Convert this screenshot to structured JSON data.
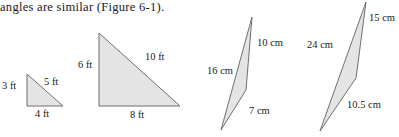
{
  "caption": {
    "text": "angles are similar (Figure 6-1)."
  },
  "colors": {
    "page_background": "#ffffff",
    "triangle_fill": "#e4e4e4",
    "triangle_stroke": "#6f6f6f",
    "text": "#1a1a1a"
  },
  "figure": {
    "name": "Figure 6-1",
    "triangles": [
      {
        "id": "triangle-1",
        "units": "ft",
        "labels": {
          "left": "3 ft",
          "hypotenuse": "5 ft",
          "bottom": "4 ft"
        },
        "points": "27,74 27,106 63,106",
        "sides": {
          "left": 3,
          "bottom": 4,
          "hypotenuse": 5
        }
      },
      {
        "id": "triangle-2",
        "units": "ft",
        "labels": {
          "left": "6 ft",
          "hypotenuse": "10 ft",
          "bottom": "8 ft"
        },
        "points": "99,33 99,106 180,106",
        "sides": {
          "left": 6,
          "bottom": 8,
          "hypotenuse": 10
        }
      },
      {
        "id": "triangle-3",
        "units": "cm",
        "labels": {
          "right": "10 cm",
          "left": "16 cm",
          "bottom": "7 cm"
        },
        "points": "252,17 246,90 221,130",
        "sides": {
          "right": 10,
          "left": 16,
          "bottom": 7
        }
      },
      {
        "id": "triangle-4",
        "units": "cm",
        "labels": {
          "right": "15 cm",
          "left": "24 cm",
          "bottom": "10.5 cm"
        },
        "points": "366,2 356,78 320,131",
        "sides": {
          "right": 15,
          "left": 24,
          "bottom": 10.5
        }
      }
    ]
  }
}
